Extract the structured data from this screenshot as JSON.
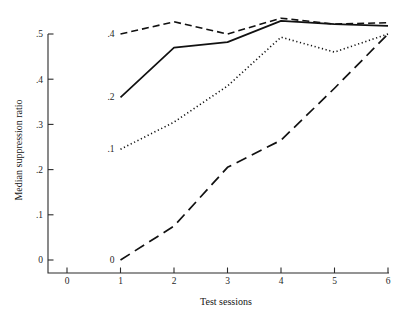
{
  "chart_data": {
    "type": "line",
    "title": "",
    "xlabel": "Test sessions",
    "ylabel": "Median suppression ratio",
    "xlim": [
      0,
      6
    ],
    "ylim": [
      0,
      0.55
    ],
    "x": [
      1,
      2,
      3,
      4,
      5,
      6
    ],
    "xticks": [
      0,
      1,
      2,
      3,
      4,
      5,
      6
    ],
    "xticklabels": [
      "0",
      "1",
      "2",
      "3",
      "4",
      "5",
      "6"
    ],
    "yticks": [
      0,
      0.1,
      0.2,
      0.3,
      0.4,
      0.5
    ],
    "yticklabels": [
      "0",
      ".1",
      ".2",
      ".3",
      ".4",
      ".5"
    ],
    "grid": false,
    "legend": "inline-labels-at-first-point",
    "series": [
      {
        "name": ".4",
        "label": ".4",
        "style": "dashed",
        "dasharray": "7,4",
        "width": 1.6,
        "values": [
          0.5,
          0.527,
          0.5,
          0.535,
          0.522,
          0.525
        ]
      },
      {
        "name": ".2",
        "label": ".2",
        "style": "solid",
        "dasharray": "none",
        "width": 1.7,
        "values": [
          0.36,
          0.47,
          0.482,
          0.529,
          0.522,
          0.518
        ]
      },
      {
        "name": ".1",
        "label": ".1",
        "style": "dotted",
        "dasharray": "1.2,2.6",
        "width": 1.6,
        "values": [
          0.245,
          0.305,
          0.385,
          0.493,
          0.46,
          0.5
        ]
      },
      {
        "name": "0",
        "label": "0",
        "style": "long-dashed",
        "dasharray": "11,6",
        "width": 1.7,
        "values": [
          0.0,
          0.075,
          0.205,
          0.265,
          0.38,
          0.5
        ]
      }
    ]
  }
}
